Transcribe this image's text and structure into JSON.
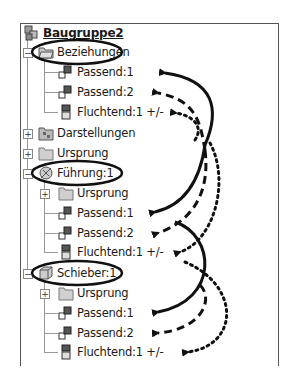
{
  "tree": {
    "root": {
      "label": "Baugruppe2",
      "icon": "assembly-icon"
    },
    "items": [
      {
        "label": "Beziehungen",
        "icon": "folder-relations-icon",
        "expander": "minus",
        "circled": true
      },
      {
        "label": "Passend:1",
        "icon": "mate-constraint-icon"
      },
      {
        "label": "Passend:2",
        "icon": "mate-constraint-icon"
      },
      {
        "label": "Fluchtend:1 +/-",
        "icon": "flush-constraint-icon"
      },
      {
        "label": "Darstellungen",
        "icon": "representations-icon",
        "expander": "plus"
      },
      {
        "label": "Ursprung",
        "icon": "origin-folder-icon",
        "expander": "plus"
      },
      {
        "label": "Führung:1",
        "icon": "part-icon",
        "expander": "minus",
        "circled": true
      },
      {
        "label": "Ursprung",
        "icon": "origin-folder-icon",
        "expander": "plus"
      },
      {
        "label": "Passend:1",
        "icon": "mate-constraint-icon"
      },
      {
        "label": "Passend:2",
        "icon": "mate-constraint-icon"
      },
      {
        "label": "Fluchtend:1 +/-",
        "icon": "flush-constraint-icon"
      },
      {
        "label": "Schieber:1",
        "icon": "part-cube-icon",
        "expander": "minus",
        "circled": true
      },
      {
        "label": "Ursprung",
        "icon": "origin-folder-icon",
        "expander": "plus"
      },
      {
        "label": "Passend:1",
        "icon": "mate-constraint-icon"
      },
      {
        "label": "Passend:2",
        "icon": "mate-constraint-icon"
      },
      {
        "label": "Fluchtend:1 +/-",
        "icon": "flush-constraint-icon"
      }
    ]
  },
  "annotations": {
    "arrow_styles": [
      "solid",
      "dashed",
      "dotted"
    ],
    "description": "Arrows link constraints in Beziehungen to the matching constraints under Führung:1 and Schieber:1",
    "color": "#111111"
  }
}
